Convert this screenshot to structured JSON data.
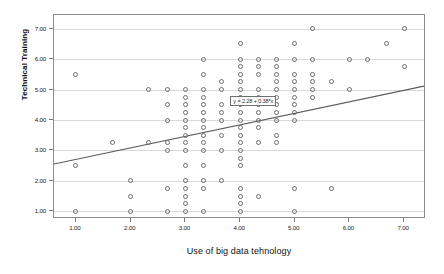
{
  "chart_data": {
    "type": "scatter",
    "title": "",
    "xlabel": "Use of big data tehnology",
    "ylabel": "Technical Training",
    "xlim": [
      0.6,
      7.4
    ],
    "ylim": [
      0.75,
      7.45
    ],
    "grid": true,
    "legend": null,
    "x_ticks": [
      "1.00",
      "2.00",
      "3.00",
      "4.00",
      "5.00",
      "6.00",
      "7.00"
    ],
    "x_tick_values": [
      1,
      2,
      3,
      4,
      5,
      6,
      7
    ],
    "y_ticks": [
      "1.00",
      "2.00",
      "3.00",
      "4.00",
      "5.00",
      "6.00",
      "7.00"
    ],
    "y_tick_values": [
      1,
      2,
      3,
      4,
      5,
      6,
      7
    ],
    "annotation": "y = 2.28 + 0.38*x",
    "fit_line": {
      "type": "linear",
      "intercept": 2.28,
      "slope": 0.38,
      "x_start": 0.6,
      "y_start": 2.51,
      "x_end": 7.4,
      "y_end": 5.09
    },
    "marker_style": "open-circle",
    "points": [
      [
        1.0,
        5.5
      ],
      [
        1.0,
        2.5
      ],
      [
        1.0,
        1.0
      ],
      [
        1.67,
        3.25
      ],
      [
        2.0,
        2.0
      ],
      [
        2.0,
        1.5
      ],
      [
        2.0,
        1.0
      ],
      [
        2.33,
        5.0
      ],
      [
        2.33,
        3.25
      ],
      [
        2.67,
        5.0
      ],
      [
        2.67,
        4.5
      ],
      [
        2.67,
        4.0
      ],
      [
        2.67,
        3.25
      ],
      [
        2.67,
        3.0
      ],
      [
        2.67,
        1.75
      ],
      [
        2.67,
        1.0
      ],
      [
        3.0,
        5.0
      ],
      [
        3.0,
        4.75
      ],
      [
        3.0,
        4.5
      ],
      [
        3.0,
        4.25
      ],
      [
        3.0,
        4.0
      ],
      [
        3.0,
        3.75
      ],
      [
        3.0,
        3.5
      ],
      [
        3.0,
        3.25
      ],
      [
        3.0,
        3.0
      ],
      [
        3.0,
        2.5
      ],
      [
        3.0,
        2.0
      ],
      [
        3.0,
        1.75
      ],
      [
        3.0,
        1.5
      ],
      [
        3.0,
        1.25
      ],
      [
        3.0,
        1.0
      ],
      [
        3.33,
        6.0
      ],
      [
        3.33,
        5.5
      ],
      [
        3.33,
        5.0
      ],
      [
        3.33,
        4.75
      ],
      [
        3.33,
        4.5
      ],
      [
        3.33,
        4.25
      ],
      [
        3.33,
        4.0
      ],
      [
        3.33,
        3.75
      ],
      [
        3.33,
        3.5
      ],
      [
        3.33,
        3.25
      ],
      [
        3.33,
        3.0
      ],
      [
        3.33,
        2.5
      ],
      [
        3.33,
        2.0
      ],
      [
        3.33,
        1.75
      ],
      [
        3.33,
        1.0
      ],
      [
        3.67,
        5.25
      ],
      [
        3.67,
        5.0
      ],
      [
        3.67,
        4.5
      ],
      [
        3.67,
        4.25
      ],
      [
        3.67,
        4.0
      ],
      [
        3.67,
        3.5
      ],
      [
        3.67,
        3.0
      ],
      [
        3.67,
        2.0
      ],
      [
        4.0,
        6.5
      ],
      [
        4.0,
        6.0
      ],
      [
        4.0,
        5.75
      ],
      [
        4.0,
        5.5
      ],
      [
        4.0,
        5.25
      ],
      [
        4.0,
        5.0
      ],
      [
        4.0,
        4.75
      ],
      [
        4.0,
        4.5
      ],
      [
        4.0,
        4.25
      ],
      [
        4.0,
        4.0
      ],
      [
        4.0,
        3.75
      ],
      [
        4.0,
        3.5
      ],
      [
        4.0,
        3.25
      ],
      [
        4.0,
        3.0
      ],
      [
        4.0,
        2.75
      ],
      [
        4.0,
        2.5
      ],
      [
        4.0,
        1.75
      ],
      [
        4.0,
        1.5
      ],
      [
        4.0,
        1.25
      ],
      [
        4.0,
        1.0
      ],
      [
        4.33,
        6.0
      ],
      [
        4.33,
        5.75
      ],
      [
        4.33,
        5.5
      ],
      [
        4.33,
        5.0
      ],
      [
        4.33,
        4.75
      ],
      [
        4.33,
        4.5
      ],
      [
        4.33,
        4.25
      ],
      [
        4.33,
        4.0
      ],
      [
        4.33,
        3.75
      ],
      [
        4.33,
        3.25
      ],
      [
        4.33,
        1.5
      ],
      [
        4.67,
        6.0
      ],
      [
        4.67,
        5.75
      ],
      [
        4.67,
        5.5
      ],
      [
        4.67,
        5.25
      ],
      [
        4.67,
        5.0
      ],
      [
        4.67,
        4.75
      ],
      [
        4.67,
        4.5
      ],
      [
        4.67,
        4.25
      ],
      [
        4.67,
        4.0
      ],
      [
        4.67,
        3.5
      ],
      [
        4.67,
        3.25
      ],
      [
        5.0,
        6.5
      ],
      [
        5.0,
        6.0
      ],
      [
        5.0,
        5.5
      ],
      [
        5.0,
        5.25
      ],
      [
        5.0,
        5.0
      ],
      [
        5.0,
        4.75
      ],
      [
        5.0,
        4.5
      ],
      [
        5.0,
        4.25
      ],
      [
        5.0,
        4.0
      ],
      [
        5.0,
        1.75
      ],
      [
        5.0,
        1.0
      ],
      [
        5.33,
        7.0
      ],
      [
        5.33,
        6.0
      ],
      [
        5.33,
        5.5
      ],
      [
        5.33,
        5.25
      ],
      [
        5.33,
        5.0
      ],
      [
        5.33,
        4.75
      ],
      [
        5.67,
        5.25
      ],
      [
        5.67,
        1.75
      ],
      [
        6.0,
        6.0
      ],
      [
        6.0,
        5.0
      ],
      [
        6.33,
        6.0
      ],
      [
        6.67,
        6.5
      ],
      [
        7.0,
        7.0
      ],
      [
        7.0,
        5.75
      ]
    ]
  }
}
